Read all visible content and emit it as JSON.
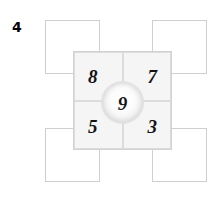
{
  "figure": {
    "number_label": "4",
    "center_value": "9",
    "grid": {
      "rows": 2,
      "cols": 2,
      "cells": [
        {
          "position": "top-left",
          "value": "8"
        },
        {
          "position": "top-right",
          "value": "7"
        },
        {
          "position": "bottom-left",
          "value": "5"
        },
        {
          "position": "bottom-right",
          "value": "3"
        }
      ]
    },
    "outer_squares": [
      {
        "position": "top-left",
        "value": ""
      },
      {
        "position": "top-right",
        "value": ""
      },
      {
        "position": "bottom-left",
        "value": ""
      },
      {
        "position": "bottom-right",
        "value": ""
      }
    ],
    "colors": {
      "page_background": "#ffffff",
      "cell_fill": "#f5f5f5",
      "cell_border": "#dcdcdc",
      "outer_square_fill": "#ffffff",
      "outer_square_border": "#cfcfcf",
      "digit_color": "#141414",
      "circle_highlight": "#ffffff",
      "circle_shade": "#e2e2e2"
    }
  }
}
